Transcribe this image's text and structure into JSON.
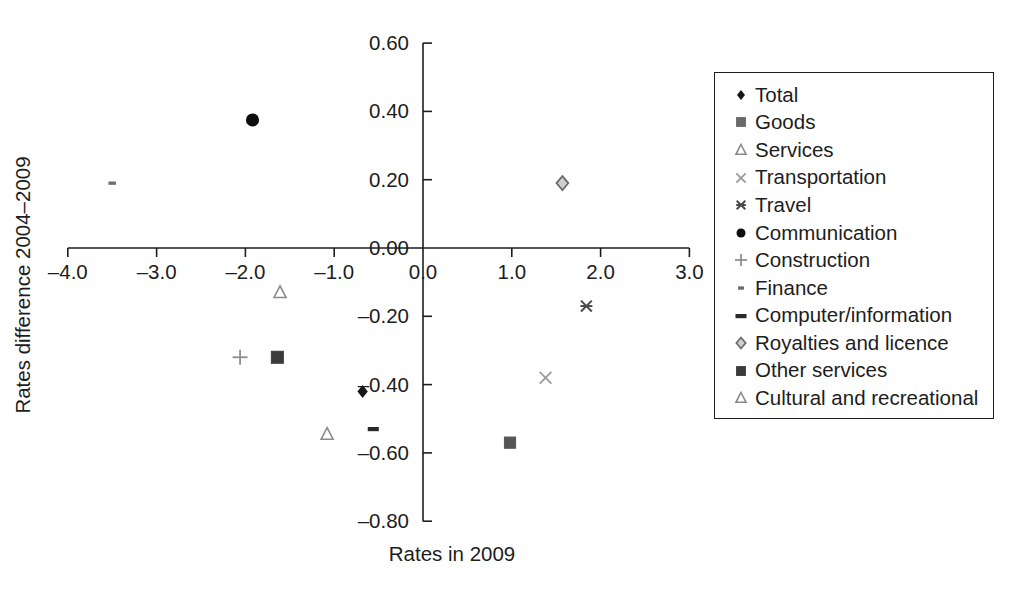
{
  "chart_data": {
    "type": "scatter",
    "title": "",
    "xlabel": "Rates in 2009",
    "ylabel": "Rates difference 2004–2009",
    "xlim": [
      -4.0,
      3.0
    ],
    "ylim": [
      -0.8,
      0.6
    ],
    "xticks": [
      "–4.0",
      "–3.0",
      "–2.0",
      "–1.0",
      "0.0",
      "1.0",
      "2.0",
      "3.0"
    ],
    "xtick_values": [
      -4.0,
      -3.0,
      -2.0,
      -1.0,
      0.0,
      1.0,
      2.0,
      3.0
    ],
    "yticks": [
      "0.60",
      "0.40",
      "0.20",
      "0.00",
      "–0.20",
      "–0.40",
      "–0.60",
      "–0.80"
    ],
    "ytick_values": [
      0.6,
      0.4,
      0.2,
      0.0,
      -0.2,
      -0.4,
      -0.6,
      -0.8
    ],
    "grid": false,
    "legend_position": "right",
    "series": [
      {
        "name": "Total",
        "marker": "diamond",
        "color": "#161616",
        "x": -0.68,
        "y": -0.42,
        "size": 13
      },
      {
        "name": "Goods",
        "marker": "square",
        "color": "#555555",
        "x": 0.98,
        "y": -0.57,
        "size": 14
      },
      {
        "name": "Services",
        "marker": "triangle",
        "color": "#8a8a8a",
        "x": -1.61,
        "y": -0.13,
        "size": 13
      },
      {
        "name": "Transportation",
        "marker": "cross-x",
        "color": "#9a9a9a",
        "x": 1.38,
        "y": -0.38,
        "size": 15
      },
      {
        "name": "Travel",
        "marker": "asterisk",
        "color": "#4a4a4a",
        "x": 1.84,
        "y": -0.17,
        "size": 15
      },
      {
        "name": "Communication",
        "marker": "circle",
        "color": "#0d0d0d",
        "x": -1.92,
        "y": 0.375,
        "size": 16
      },
      {
        "name": "Construction",
        "marker": "plus",
        "color": "#8f8f8f",
        "x": -2.06,
        "y": -0.32,
        "size": 15
      },
      {
        "name": "Finance",
        "marker": "dash-small",
        "color": "#6e6e6e",
        "x": -3.5,
        "y": 0.19,
        "size": 10
      },
      {
        "name": "Computer/information",
        "marker": "dash-bold",
        "color": "#2a2a2a",
        "x": -0.56,
        "y": -0.53,
        "size": 13
      },
      {
        "name": "Royalties and licence",
        "marker": "diamond-open",
        "color": "#6a6a6a",
        "x": 1.57,
        "y": 0.19,
        "size": 14
      },
      {
        "name": "Other services",
        "marker": "square",
        "color": "#3b3b3b",
        "x": -1.64,
        "y": -0.32,
        "size": 15
      },
      {
        "name": "Cultural and recreational",
        "marker": "triangle",
        "color": "#8a8a8a",
        "x": -1.08,
        "y": -0.545,
        "size": 13
      }
    ]
  },
  "legend": {
    "items": [
      {
        "label": "Total",
        "marker": "diamond",
        "color": "#161616"
      },
      {
        "label": "Goods",
        "marker": "square",
        "color": "#6a6a6a"
      },
      {
        "label": "Services",
        "marker": "triangle",
        "color": "#8a8a8a"
      },
      {
        "label": "Transportation",
        "marker": "cross-x",
        "color": "#9a9a9a"
      },
      {
        "label": "Travel",
        "marker": "asterisk",
        "color": "#4a4a4a"
      },
      {
        "label": "Communication",
        "marker": "circle",
        "color": "#0d0d0d"
      },
      {
        "label": "Construction",
        "marker": "plus",
        "color": "#8f8f8f"
      },
      {
        "label": "Finance",
        "marker": "dash-small",
        "color": "#6e6e6e"
      },
      {
        "label": "Computer/information",
        "marker": "dash-bold",
        "color": "#2a2a2a"
      },
      {
        "label": "Royalties and licence",
        "marker": "diamond-open",
        "color": "#6a6a6a"
      },
      {
        "label": "Other services",
        "marker": "square",
        "color": "#3b3b3b"
      },
      {
        "label": "Cultural and recreational",
        "marker": "triangle",
        "color": "#8a8a8a"
      }
    ]
  },
  "colors": {
    "axis": "#1d1d1d",
    "text": "#1d1d1d",
    "background": "#ffffff",
    "legend_border": "#1d1d1d"
  }
}
